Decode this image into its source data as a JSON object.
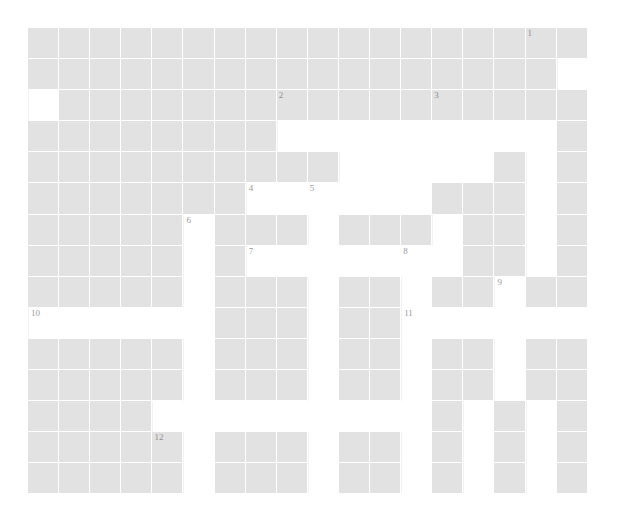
{
  "puzzle": {
    "title": "Crossword Grid",
    "kind": "crossword",
    "columns": 18,
    "rows": 15,
    "cell_size_px": 31.1,
    "grid_origin_px": {
      "x": 28,
      "y": 28
    },
    "colors": {
      "page_background": "#ffffff",
      "block_cell": "#e2e2e2",
      "open_cell": "#ffffff",
      "grid_line": "#ffffff",
      "clue_number": "#9a9a9a"
    },
    "grid": [
      "..................",
      ".................#",
      "#.................",
      "........#########.",
      "..........#####.#.",
      ".......######...#.",
      ".....#...#...#..#.",
      ".....#.#######..#.",
      ".....#...#..#..#..",
      "######...#..######",
      ".....#...#..#..#..",
      ".....#...#..#..#..",
      "....#########.#.#.",
      ".....#...#..#.#.#.",
      ".....#...#..#.#.#."
    ],
    "numbered_cells": [
      {
        "number": "1",
        "row": 0,
        "col": 16
      },
      {
        "number": "2",
        "row": 2,
        "col": 8
      },
      {
        "number": "3",
        "row": 2,
        "col": 13
      },
      {
        "number": "4",
        "row": 5,
        "col": 7
      },
      {
        "number": "5",
        "row": 5,
        "col": 9
      },
      {
        "number": "6",
        "row": 6,
        "col": 5
      },
      {
        "number": "7",
        "row": 7,
        "col": 7
      },
      {
        "number": "8",
        "row": 7,
        "col": 12
      },
      {
        "number": "9",
        "row": 8,
        "col": 15
      },
      {
        "number": "10",
        "row": 9,
        "col": 0
      },
      {
        "number": "11",
        "row": 9,
        "col": 12
      },
      {
        "number": "12",
        "row": 13,
        "col": 4
      }
    ],
    "letters": []
  }
}
